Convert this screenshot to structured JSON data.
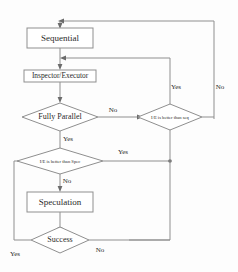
{
  "diagram": {
    "colors": {
      "line": "#8f8f8f",
      "text": "#2b2b2b",
      "background": "#fdfdfd",
      "shape_fill": "#ffffff",
      "arrow": "#6b6b6b"
    },
    "nodes": [
      {
        "id": "sequential",
        "type": "process",
        "label": "Sequential"
      },
      {
        "id": "inspector",
        "type": "process",
        "label": "Inspector/Executor"
      },
      {
        "id": "fully_parallel",
        "type": "decision",
        "label": "Fully Parallel"
      },
      {
        "id": "ie_vs_seq",
        "type": "decision",
        "label": "I/E is better than seq"
      },
      {
        "id": "ie_vs_spec",
        "type": "decision",
        "label": "I/E is better than Spec"
      },
      {
        "id": "speculation",
        "type": "process",
        "label": "Speculation"
      },
      {
        "id": "success",
        "type": "decision",
        "label": "Success"
      }
    ],
    "edge_labels": {
      "fully_parallel_no": "No",
      "fully_parallel_yes": "Yes",
      "ie_vs_seq_yes": "Yes",
      "ie_vs_seq_no": "No",
      "ie_vs_spec_yes": "Yes",
      "ie_vs_spec_no": "No",
      "success_yes": "Yes",
      "success_no": "No"
    }
  }
}
